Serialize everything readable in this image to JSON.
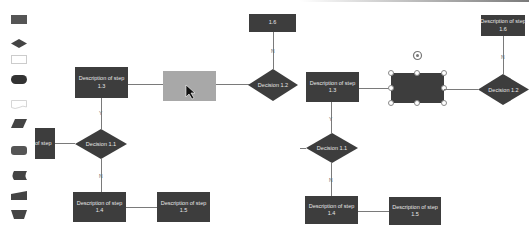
{
  "palette": {
    "shapes": [
      {
        "name": "process",
        "icon": "rectangle-icon"
      },
      {
        "name": "decision",
        "icon": "diamond-icon"
      },
      {
        "name": "alternate",
        "icon": "outline-rectangle-icon"
      },
      {
        "name": "terminator",
        "icon": "rounded-pill-icon"
      },
      {
        "name": "document",
        "icon": "document-icon"
      },
      {
        "name": "data",
        "icon": "parallelogram-icon"
      },
      {
        "name": "rounded-process",
        "icon": "rounded-rectangle-icon"
      },
      {
        "name": "stored-data",
        "icon": "stored-data-icon"
      },
      {
        "name": "manual-input",
        "icon": "manual-input-icon"
      },
      {
        "name": "manual-operation",
        "icon": "trapezoid-icon"
      }
    ]
  },
  "left_diagram": {
    "step_partial": "of step",
    "step_1_3": "Description of step\n1.3",
    "step_1_4": "Description of step\n1.4",
    "step_1_5": "Description of step\n1.5",
    "step_1_6": "1.6",
    "decision_1_1": "Decision 1.1",
    "decision_1_2": "Decision 1.2",
    "label_y": "Y",
    "label_n_down": "N",
    "label_n_up": "N"
  },
  "right_diagram": {
    "step_1_3": "Description of step\n1.3",
    "step_1_4": "Description of step\n1.4",
    "step_1_5": "Description of step\n1.5",
    "step_1_6": "Description of step\n1.6",
    "decision_1_1": "Decision 1.1",
    "decision_1_2": "Decision 1.2",
    "label_y": "Y",
    "label_n_down": "N",
    "label_n_up": "N"
  },
  "colors": {
    "shape_fill": "#3d3d3d",
    "ghost_fill": "#a8a8a8",
    "connector": "#7a7a7a"
  }
}
